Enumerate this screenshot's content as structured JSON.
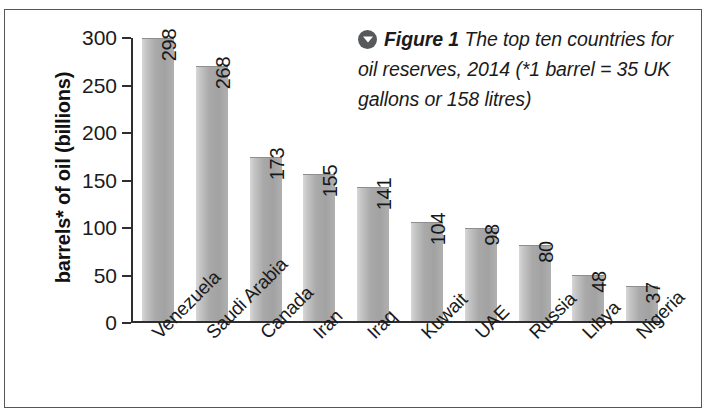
{
  "figure": {
    "caption_marker_icon": "chevron-down-circle-icon",
    "caption_label": "Figure 1",
    "caption_body": " The top ten countries for oil reserves, 2014 (*1 barrel = 35 UK gallons or 158 litres)",
    "frame_color": "#55565a",
    "bar_color": "#a9a9a9",
    "axis_color": "#2e2e30",
    "text_color": "#1b1b1b"
  },
  "chart_data": {
    "type": "bar",
    "title": "",
    "xlabel": "",
    "ylabel": "barrels* of oil (billions)",
    "ylim": [
      0,
      300
    ],
    "yticks": [
      0,
      50,
      100,
      150,
      200,
      250,
      300
    ],
    "ytick_labels": [
      "0",
      "50",
      "100",
      "150",
      "200",
      "250",
      "300"
    ],
    "grid": false,
    "legend": false,
    "categories": [
      "Venezuela",
      "Saudi Arabia",
      "Canada",
      "Iran",
      "Iraq",
      "Kuwait",
      "UAE",
      "Russia",
      "Libya",
      "Nigeria"
    ],
    "values": [
      298,
      268,
      173,
      155,
      141,
      104,
      98,
      80,
      48,
      37
    ],
    "value_labels": [
      "298",
      "268",
      "173",
      "155",
      "141",
      "104",
      "98",
      "80",
      "48",
      "37"
    ],
    "data_label_position": "inside-top-rotated"
  }
}
